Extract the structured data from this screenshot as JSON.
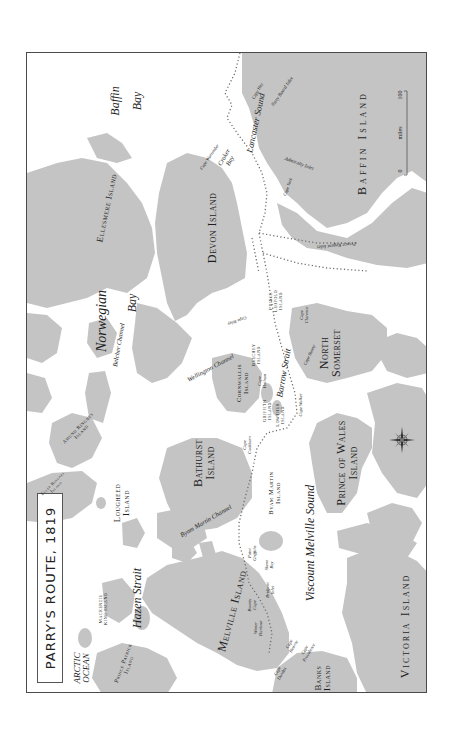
{
  "title": "PARRY'S ROUTE, 1819",
  "colors": {
    "land": "#c4c4c4",
    "water": "#ffffff",
    "route": "#6e6e6e",
    "frame": "#4a4a4a",
    "text": "#1e1e1e"
  },
  "scale": {
    "start": "0",
    "end": "100",
    "unit": "miles"
  },
  "compass": {
    "n": "N",
    "s": "S",
    "e": "E",
    "w": "W"
  },
  "labels": {
    "baffin_bay_1": "Baffin",
    "baffin_bay_2": "Bay",
    "lancaster_sound": "Lancaster Sound",
    "navy_board_inlet": "Navy Board Inlet",
    "cape_hay": "Cape Hay",
    "baffin_island": "Baffin Island",
    "admiralty_inlet": "Admiralty Inlet",
    "cape_york": "Cape York",
    "prince_regent_inlet": "Prince Regent Inlet",
    "cape_warrender": "Cape Warrender",
    "croker_bay_1": "Croker",
    "croker_bay_2": "Bay",
    "devon_island": "Devon Island",
    "ellesmere_island": "Ellesmere Island",
    "norwegian_bay_1": "Norwegian",
    "norwegian_bay_2": "Bay",
    "belcher_channel": "Belcher Channel",
    "cape_riley": "Cape Riley",
    "prince_leopold_island_1": "Prince",
    "prince_leopold_island_2": "Leopold",
    "prince_leopold_island_3": "Island",
    "cape_clarence_1": "Cape",
    "cape_clarence_2": "Clarence",
    "north_somerset_1": "North",
    "north_somerset_2": "Somerset",
    "cape_bunny": "Cape Bunny",
    "barrow_strait": "Barrow Strait",
    "beechey_island_1": "Beechey",
    "beechey_island_2": "Island",
    "cape_hotham_1": "Cape",
    "cape_hotham_2": "Hotham",
    "wellington_channel": "Wellington Channel",
    "cornwallis_island_1": "Cornwallis",
    "cornwallis_island_2": "Island",
    "griffith_island_1": "Griffith",
    "griffith_island_2": "Island",
    "lowther_island_1": "Lowther",
    "lowther_island_2": "Island",
    "cape_walker": "Cape Walker",
    "prince_of_wales_island_1": "Prince of Wales",
    "prince_of_wales_island_2": "Island",
    "amund_ringnes_island_1": "Amund Ringnes",
    "amund_ringnes_island_2": "Island",
    "ellef_ringnes_island_1": "Ellef Ringnes",
    "ellef_ringnes_island_2": "Island",
    "lougheed_island_1": "Lougheed",
    "lougheed_island_2": "Island",
    "bathurst_island_1": "Bathurst",
    "bathurst_island_2": "Island",
    "cape_cockburn_1": "Cape",
    "cape_cockburn_2": "Cockburn",
    "byam_martin_channel": "Byam Martin Channel",
    "byam_martin_island_1": "Byam Martin",
    "byam_martin_island_2": "Island",
    "viscount_melville_sound": "Viscount Melville Sound",
    "point_griffiths_1": "Point",
    "point_griffiths_2": "Griffiths",
    "skene_bay_1": "Skene",
    "skene_bay_2": "Bay",
    "bridport_inlet_1": "Bridport",
    "bridport_inlet_2": "Inlet",
    "bounty_cape_1": "Bounty",
    "bounty_cape_2": "Cape",
    "winter_harbour_1": "Winter",
    "winter_harbour_2": "Harbour",
    "cape_hearne_1": "Cape",
    "cape_hearne_2": "Hearne",
    "cape_providence_1": "Cape",
    "cape_providence_2": "Providence",
    "cape_dundas_1": "Cape",
    "cape_dundas_2": "Dundas",
    "melville_island": "Melville Island",
    "hazen_strait": "Hazen Strait",
    "mackenzie_king_island_1": "Mackenzie",
    "mackenzie_king_island_2": "King Island",
    "arctic_ocean_1": "ARCTIC",
    "arctic_ocean_2": "OCEAN",
    "prince_patrick_island_1": "Prince Patrick",
    "prince_patrick_island_2": "Island",
    "banks_island_1": "Banks",
    "banks_island_2": "Island",
    "victoria_island": "Victoria Island"
  }
}
